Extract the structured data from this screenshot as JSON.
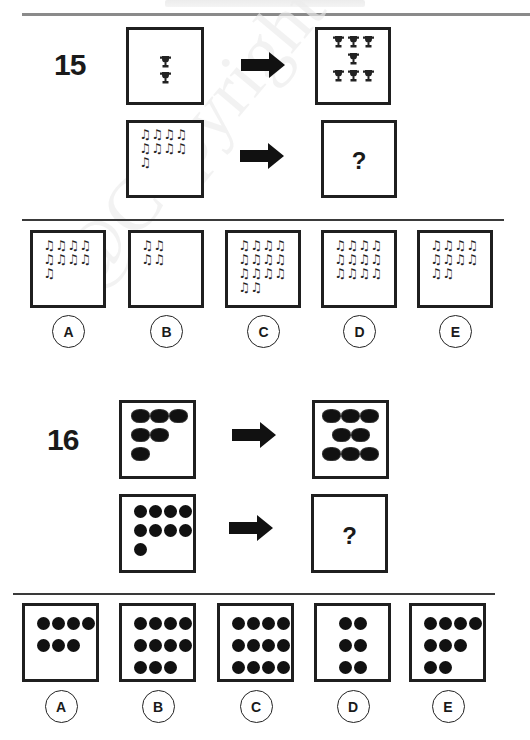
{
  "header": {
    "faint_title": ""
  },
  "watermark": "@Copyright Goods",
  "questions": [
    {
      "number": "15",
      "icon_kind": "music-note",
      "example": {
        "left": {
          "icon": "trophy",
          "count": 2,
          "layout": [
            1,
            1
          ]
        },
        "right": {
          "icon": "trophy",
          "count": 7,
          "layout": [
            3,
            1,
            3
          ]
        }
      },
      "problem": {
        "left": {
          "icon": "music-note",
          "count": 9,
          "layout": [
            4,
            4,
            1
          ]
        },
        "right": {
          "symbol": "?"
        }
      },
      "options": [
        {
          "label": "A",
          "count": 9,
          "layout": [
            4,
            4,
            1
          ]
        },
        {
          "label": "B",
          "count": 4,
          "layout": [
            2,
            2
          ]
        },
        {
          "label": "C",
          "count": 14,
          "layout": [
            4,
            4,
            4,
            2
          ]
        },
        {
          "label": "D",
          "count": 12,
          "layout": [
            4,
            4,
            4
          ]
        },
        {
          "label": "E",
          "count": 10,
          "layout": [
            4,
            4,
            2
          ]
        }
      ]
    },
    {
      "number": "16",
      "icon_kind": "dot",
      "example": {
        "left": {
          "icon": "fuzzy-blob",
          "count": 6,
          "layout": [
            3,
            2,
            1
          ]
        },
        "right": {
          "icon": "fuzzy-blob",
          "count": 8,
          "layout": [
            3,
            2,
            3
          ]
        }
      },
      "problem": {
        "left": {
          "icon": "dot",
          "count": 9,
          "layout": [
            4,
            4,
            1
          ]
        },
        "right": {
          "symbol": "?"
        }
      },
      "options": [
        {
          "label": "A",
          "count": 7,
          "layout": [
            4,
            3
          ]
        },
        {
          "label": "B",
          "count": 11,
          "layout": [
            4,
            4,
            3
          ]
        },
        {
          "label": "C",
          "count": 12,
          "layout": [
            4,
            4,
            4
          ]
        },
        {
          "label": "D",
          "count": 6,
          "layout": [
            2,
            2,
            2
          ]
        },
        {
          "label": "E",
          "count": 9,
          "layout": [
            4,
            3,
            2
          ]
        }
      ]
    }
  ]
}
